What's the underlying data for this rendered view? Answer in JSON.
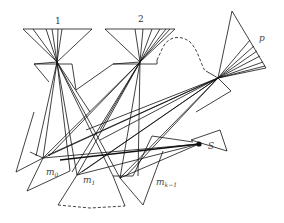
{
  "diagram": {
    "labels": {
      "node1": "1",
      "node2": "2",
      "nodeP": "p",
      "nodeS": "S",
      "m0_base": "m",
      "m0_sub": "0",
      "m1_base": "m",
      "m1_sub": "1",
      "mk_base": "m",
      "mk_sub": "k−1"
    },
    "colors": {
      "stroke": "#111111",
      "background": "#ffffff"
    },
    "nodes": [
      {
        "id": "1",
        "apex": [
          57,
          62
        ],
        "top_left": [
          23,
          29
        ],
        "top_right": [
          92,
          29
        ]
      },
      {
        "id": "2",
        "apex": [
          140,
          62
        ],
        "top_left": [
          105,
          29
        ],
        "top_right": [
          175,
          29
        ]
      },
      {
        "id": "p",
        "apex": [
          218,
          78
        ],
        "tip_top": [
          232,
          11
        ],
        "tip_right": [
          266,
          68
        ]
      },
      {
        "id": "S",
        "point": [
          199,
          144
        ]
      },
      {
        "id": "m0",
        "point": [
          43,
          158
        ]
      },
      {
        "id": "m1",
        "point": [
          77,
          175
        ]
      },
      {
        "id": "mk-1",
        "point": [
          120,
          178
        ]
      }
    ],
    "edges_dashed": [
      {
        "from": "2",
        "to": "p",
        "style": "dashed-curve"
      },
      {
        "from": "m1",
        "to": "mk-1",
        "style": "dashed-line"
      }
    ]
  }
}
